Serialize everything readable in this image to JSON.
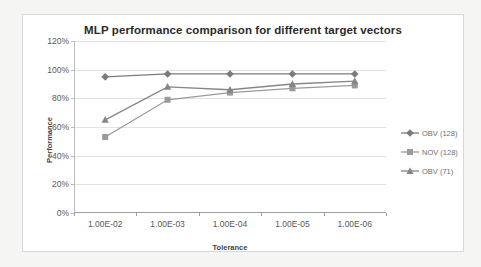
{
  "chart_data": {
    "type": "line",
    "title": "MLP performance comparison for different target vectors",
    "xlabel": "Tolerance",
    "ylabel": "Performance",
    "categories": [
      "1.00E-02",
      "1.00E-03",
      "1.00E-04",
      "1.00E-05",
      "1.00E-06"
    ],
    "ylim": [
      0,
      120
    ],
    "ytick_labels": [
      "0%",
      "20%",
      "40%",
      "60%",
      "80%",
      "100%",
      "120%"
    ],
    "ytick_values": [
      0,
      20,
      40,
      60,
      80,
      100,
      120
    ],
    "grid": true,
    "legend_position": "right",
    "series": [
      {
        "name": "OBV (128)",
        "marker": "diamond",
        "color": "#7b7b7b",
        "values": [
          95,
          97,
          97,
          97,
          97
        ]
      },
      {
        "name": "NOV (128)",
        "marker": "square",
        "color": "#9a9a9a",
        "values": [
          53,
          79,
          84,
          87,
          89
        ]
      },
      {
        "name": "OBV (71)",
        "marker": "triangle",
        "color": "#868686",
        "values": [
          65,
          88,
          86,
          90,
          92
        ]
      }
    ]
  },
  "colors": {
    "frame_border": "#d8d8d8",
    "gridline": "#e2e2e2",
    "axis": "#9f9f9f",
    "title_text": "#2b2b2b",
    "tick_text": "#58595b",
    "page_background": "#f5f5f3",
    "canvas_background": "#ffffff"
  }
}
